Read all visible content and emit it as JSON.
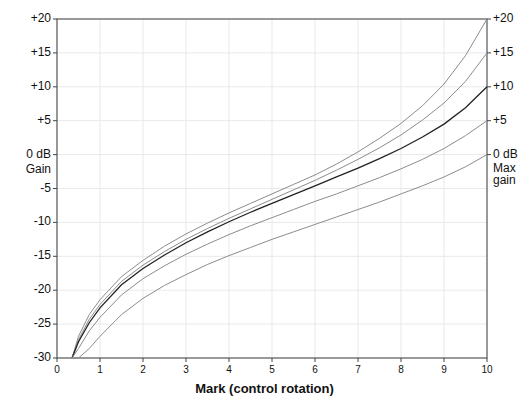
{
  "chart_data": {
    "type": "line",
    "title": "",
    "xlabel": "Mark  (control rotation)",
    "ylabel": "Gain",
    "ylabel_unit": "0 dB",
    "right_axis_label": "Max gain",
    "xlim": [
      0,
      10
    ],
    "ylim": [
      -30,
      20
    ],
    "grid": true,
    "legend": "none",
    "x_ticks": [
      "0",
      "1",
      "2",
      "3",
      "4",
      "5",
      "6",
      "7",
      "8",
      "9",
      "10"
    ],
    "x_tick_values": [
      0,
      1,
      2,
      3,
      4,
      5,
      6,
      7,
      8,
      9,
      10
    ],
    "y_ticks": [
      "+20",
      "+15",
      "+10",
      "+5",
      "0 dB",
      "-5",
      "-10",
      "-15",
      "-20",
      "-25",
      "-30"
    ],
    "y_tick_values": [
      20,
      15,
      10,
      5,
      0,
      -5,
      -10,
      -15,
      -20,
      -25,
      -30
    ],
    "y_ticks_right": [
      "+20",
      "+15",
      "+10",
      "+5",
      "0 dB"
    ],
    "y_tick_values_right": [
      20,
      15,
      10,
      5,
      0
    ],
    "x": [
      0.35,
      0.5,
      0.75,
      1,
      1.5,
      2,
      2.5,
      3,
      3.5,
      4,
      4.5,
      5,
      5.5,
      6,
      6.5,
      7,
      7.5,
      8,
      8.5,
      9,
      9.5,
      10
    ],
    "series": [
      {
        "name": "Max gain +20 dB",
        "end_label": "+20",
        "emphasis": false,
        "values": [
          -30,
          -26.8,
          -23.6,
          -21.4,
          -18.0,
          -15.6,
          -13.5,
          -11.7,
          -10.1,
          -8.6,
          -7.2,
          -5.8,
          -4.4,
          -3.0,
          -1.4,
          0.4,
          2.4,
          4.6,
          7.2,
          10.4,
          14.6,
          20.0
        ]
      },
      {
        "name": "Max gain +15 dB",
        "end_label": "+15",
        "emphasis": false,
        "values": [
          -30,
          -27.3,
          -24.3,
          -22.1,
          -18.7,
          -16.3,
          -14.3,
          -12.5,
          -10.9,
          -9.4,
          -8.0,
          -6.6,
          -5.2,
          -3.8,
          -2.3,
          -0.7,
          1.0,
          2.9,
          5.1,
          7.6,
          10.8,
          15.0
        ]
      },
      {
        "name": "Max gain +10 dB",
        "end_label": "+10",
        "emphasis": true,
        "values": [
          -30,
          -27.6,
          -24.8,
          -22.6,
          -19.2,
          -16.8,
          -14.8,
          -13.0,
          -11.4,
          -9.9,
          -8.5,
          -7.2,
          -5.9,
          -4.6,
          -3.3,
          -2.0,
          -0.6,
          0.9,
          2.6,
          4.5,
          6.9,
          10.0
        ]
      },
      {
        "name": "Max gain +5 dB",
        "end_label": "+5",
        "emphasis": false,
        "values": [
          -30,
          -28.6,
          -26.0,
          -24.0,
          -20.7,
          -18.3,
          -16.4,
          -14.7,
          -13.2,
          -11.8,
          -10.5,
          -9.3,
          -8.1,
          -6.9,
          -5.8,
          -4.6,
          -3.4,
          -2.1,
          -0.7,
          0.9,
          2.8,
          5.0
        ]
      },
      {
        "name": "Max gain 0 dB",
        "end_label": "0 dB",
        "emphasis": false,
        "values": [
          -30,
          -30,
          -28.6,
          -26.8,
          -23.6,
          -21.2,
          -19.3,
          -17.7,
          -16.2,
          -14.9,
          -13.7,
          -12.5,
          -11.4,
          -10.3,
          -9.2,
          -8.1,
          -7.0,
          -5.8,
          -4.6,
          -3.3,
          -1.8,
          0.0
        ]
      }
    ]
  },
  "axes": {
    "x_title": "Mark  (control rotation)",
    "y_title_line1": "0 dB",
    "y_title_line2": "Gain",
    "right_title_line1": "0 dB",
    "right_title_line2": "Max",
    "right_title_line3": "gain"
  },
  "colors": {
    "curve": "#8c8c8c",
    "curve_bold": "#222222",
    "frame": "#555555",
    "grid": "#e9e9ec",
    "text": "#111111",
    "background": "#ffffff"
  }
}
